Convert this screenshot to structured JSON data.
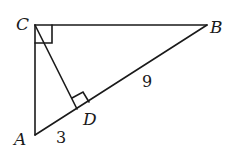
{
  "diagram": {
    "type": "right-triangle-with-altitude",
    "points": {
      "A": {
        "label": "A",
        "x": 35,
        "y": 135
      },
      "B": {
        "label": "B",
        "x": 207,
        "y": 25
      },
      "C": {
        "label": "C",
        "x": 35,
        "y": 25
      },
      "D": {
        "label": "D",
        "x": 77,
        "y": 109
      }
    },
    "segments": [
      "AC",
      "CB",
      "AB",
      "CD"
    ],
    "right_angles": [
      "C",
      "D"
    ],
    "measurements": {
      "AD": "3",
      "DB": "9"
    },
    "stroke_color": "#1a1a1a",
    "background": "#ffffff"
  }
}
